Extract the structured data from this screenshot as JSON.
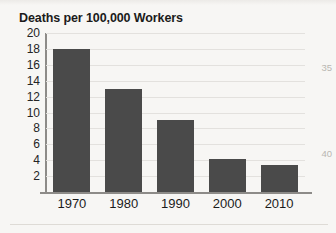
{
  "figure": {
    "title": "Deaths per 100,000 Workers"
  },
  "margin_numbers": [
    {
      "label": "35",
      "top_px": 62
    },
    {
      "label": "40",
      "top_px": 148
    }
  ],
  "colors": {
    "bar": "#4a4a4a",
    "gridline": "#e3e1de",
    "axis": "#8d8b88",
    "text": "#1b1b1b",
    "page_background": "#f7f6f4",
    "margin_number": "#b9b6b2"
  },
  "chart_data": {
    "type": "bar",
    "title": "Deaths per 100,000 Workers",
    "xlabel": "",
    "ylabel": "",
    "categories": [
      "1970",
      "1980",
      "1990",
      "2000",
      "2010"
    ],
    "values": [
      18,
      13,
      9,
      4.1,
      3.4
    ],
    "ylim": [
      0,
      20
    ],
    "ytick_labels": [
      "20",
      "18",
      "16",
      "14",
      "12",
      "10",
      "8",
      "6",
      "4",
      "2"
    ],
    "ytick_values": [
      20,
      18,
      16,
      14,
      12,
      10,
      8,
      6,
      4,
      2
    ],
    "grid": true,
    "grid_axis": "y",
    "legend": false,
    "bar_color": "#4a4a4a"
  }
}
